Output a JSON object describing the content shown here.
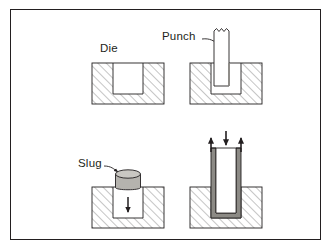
{
  "figure": {
    "border_color": "#231f20",
    "background_color": "#ffffff",
    "line_color": "#231f20",
    "hatch_color": "#6f6f6f",
    "slug_fill": "#b5b3ae",
    "cup_fill": "#8c8a85",
    "cavity_fill": "#ffffff"
  },
  "labels": {
    "die": "Die",
    "punch": "Punch",
    "slug": "Slug"
  },
  "panels": [
    {
      "id": "panel-top-left",
      "name": "die-only",
      "label": "Die",
      "caption": "Die block with open cavity"
    },
    {
      "id": "panel-top-right",
      "name": "punch-entering-die",
      "label": "Punch",
      "caption": "Punch descending into die cavity"
    },
    {
      "id": "panel-bottom-left",
      "name": "slug-ejected",
      "label": "Slug",
      "caption": "Slug moving down out of the die"
    },
    {
      "id": "panel-bottom-right",
      "name": "drawn-cup-stripping",
      "label": "",
      "caption": "Drawn cup with punch force down and stripping forces up"
    }
  ],
  "arrows": [
    {
      "name": "punch-leader-arrow",
      "direction": "right-down",
      "panel": "panel-top-right"
    },
    {
      "name": "slug-leader-arrow",
      "direction": "right-down",
      "panel": "panel-bottom-left"
    },
    {
      "name": "slug-down-arrow",
      "direction": "down",
      "panel": "panel-bottom-left"
    },
    {
      "name": "punch-force-down-arrow",
      "direction": "down",
      "panel": "panel-bottom-right"
    },
    {
      "name": "stripping-force-left-arrow",
      "direction": "up",
      "panel": "panel-bottom-right"
    },
    {
      "name": "stripping-force-right-arrow",
      "direction": "up",
      "panel": "panel-bottom-right"
    }
  ]
}
